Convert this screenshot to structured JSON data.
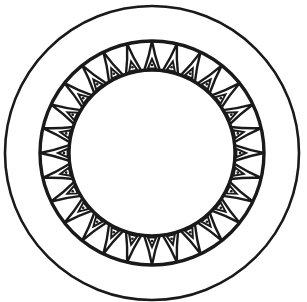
{
  "figure": {
    "stroke_color": "#1a1a1a",
    "background": "#ffffff",
    "center": [
      152,
      153
    ],
    "outer_circle_radius": 147,
    "band_outer_radius": 112,
    "band_inner_radius": 83,
    "segment_count": 28
  }
}
